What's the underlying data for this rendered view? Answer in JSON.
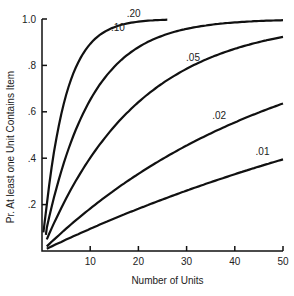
{
  "chart_data": {
    "type": "line",
    "title": "",
    "xlabel": "Number of Units",
    "ylabel": "Pr. At least one Unit Contains Item",
    "xlim": [
      0,
      50
    ],
    "ylim": [
      0,
      1.0
    ],
    "x_ticks": [
      "10",
      "20",
      "30",
      "40",
      "50"
    ],
    "y_ticks": [
      "1.0",
      ".8",
      ".6",
      ".4",
      ".2"
    ],
    "grid": false,
    "formula": "P = 1 - (1 - p)^n",
    "series": [
      {
        "name": ".20",
        "p": 0.2,
        "x_max": 26
      },
      {
        "name": ".10",
        "p": 0.1,
        "x_max": 50
      },
      {
        "name": ".05",
        "p": 0.05,
        "x_max": 50
      },
      {
        "name": ".02",
        "p": 0.02,
        "x_max": 50
      },
      {
        "name": ".01",
        "p": 0.01,
        "x_max": 50
      }
    ],
    "sample_values": {
      "x": [
        1,
        5,
        10,
        20,
        30,
        40,
        50
      ],
      ".20": [
        0.2,
        0.67,
        0.89,
        0.99,
        null,
        null,
        null
      ],
      ".10": [
        0.1,
        0.41,
        0.65,
        0.88,
        0.96,
        0.99,
        0.99
      ],
      ".05": [
        0.05,
        0.23,
        0.4,
        0.64,
        0.79,
        0.87,
        0.92
      ],
      ".02": [
        0.02,
        0.1,
        0.18,
        0.33,
        0.45,
        0.55,
        0.64
      ],
      ".01": [
        0.01,
        0.05,
        0.1,
        0.18,
        0.26,
        0.33,
        0.39
      ]
    }
  }
}
